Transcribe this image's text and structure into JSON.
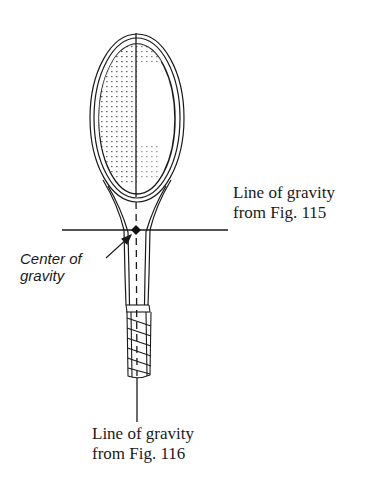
{
  "figure": {
    "labels": {
      "line_of_gravity_115": {
        "line1": "Line of gravity",
        "line2": "from Fig. 115"
      },
      "line_of_gravity_116": {
        "line1": "Line of gravity",
        "line2": "from Fig. 116"
      },
      "center_of_gravity": {
        "line1": "Center of",
        "line2": "gravity"
      }
    },
    "colors": {
      "ink": "#1a1a1a",
      "background": "#ffffff"
    }
  }
}
